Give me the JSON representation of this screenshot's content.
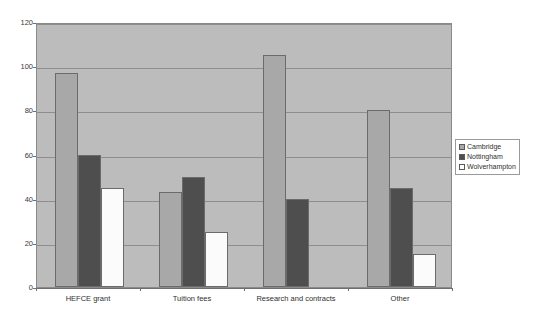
{
  "chart_data": {
    "type": "bar",
    "title": "",
    "subtitle": "",
    "xlabel": "",
    "ylabel": "",
    "categories": [
      "HEFCE grant",
      "Tuition fees",
      "Research and contracts",
      "Other"
    ],
    "series": [
      {
        "name": "Cambridge",
        "values": [
          97,
          43,
          105,
          80
        ],
        "color": "#a8a8a8"
      },
      {
        "name": "Nottingham",
        "values": [
          60,
          50,
          40,
          45
        ],
        "color": "#4e4e4e"
      },
      {
        "name": "Wolverhampton",
        "values": [
          45,
          25,
          0,
          15
        ],
        "color": "#ffffff"
      }
    ],
    "ylim": [
      0,
      120
    ],
    "ytick_labels": [
      "0",
      "20",
      "40",
      "60",
      "80",
      "100",
      "120"
    ],
    "ytick_values": [
      0,
      20,
      40,
      60,
      80,
      100,
      120
    ],
    "grid": true,
    "legend_position": "right",
    "plot_background": "#bcbcbc",
    "figure_background": "#ffffff"
  },
  "legend": {
    "entries": [
      {
        "label": "Cambridge"
      },
      {
        "label": "Nottingham"
      },
      {
        "label": "Wolverhampton"
      }
    ]
  }
}
